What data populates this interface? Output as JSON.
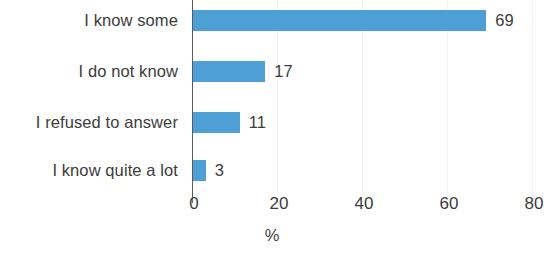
{
  "chart_data": {
    "type": "bar",
    "orientation": "horizontal",
    "title": "",
    "subtitle": "",
    "xlabel": "%",
    "ylabel": "",
    "categories": [
      "I know some",
      "I do not know",
      "I refused to answer",
      "I know quite a lot"
    ],
    "values": [
      69,
      17,
      11,
      3
    ],
    "value_labels": [
      "69",
      "17",
      "11",
      "3"
    ],
    "series": [
      {
        "name": "",
        "values": [
          69,
          17,
          11,
          3
        ]
      }
    ],
    "xlim": [
      0,
      80
    ],
    "xticks": [
      0,
      20,
      40,
      60,
      80
    ],
    "xtick_labels": [
      "0",
      "20",
      "40",
      "60",
      "80"
    ],
    "grid": "faint-vertical",
    "legend": "none",
    "bar_color": "#4e9fd4",
    "text_color": "#3c3c3c",
    "axis_color": "#5a5a5a",
    "background": "#ffffff"
  }
}
